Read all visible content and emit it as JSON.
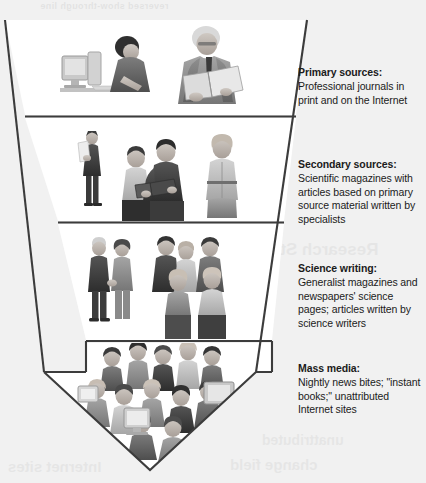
{
  "diagram": {
    "type": "inverted-funnel-arrow",
    "shape_name": "downward arrow funnel",
    "background_color": "#f1f1f1",
    "outline_color": "#3c3c3c",
    "band_fill_color": "#ffffff",
    "band_count": 4
  },
  "bands": [
    {
      "id": "primary",
      "title": "Primary sources:",
      "body": "Professional journals in print and on the Internet",
      "body_lines": [
        "Professional journals",
        "in print and on the",
        "Internet"
      ],
      "image_alt": "A man typing at a desktop computer and an older man in a suit reading a large open journal",
      "figures": [
        "person-at-computer",
        "man-reading-journal"
      ]
    },
    {
      "id": "secondary",
      "title": "Secondary sources:",
      "body": "Scientific magazines with articles based on primary source material written by specialists",
      "body_lines": [
        "Scientific magazines",
        "with articles based on",
        "primary source material",
        "written by specialists"
      ],
      "image_alt": "A standing man reading a document, two people sharing an open book, and a woman standing",
      "figures": [
        "standing-man-reading",
        "two-people-with-book",
        "standing-woman"
      ]
    },
    {
      "id": "science-writing",
      "title": "Science writing:",
      "body": "Generalist magazines and newspapers' science pages; articles written by science writers",
      "body_lines": [
        "Generalist magazines",
        "and newspapers' science",
        "pages; articles written",
        "by science writers"
      ],
      "image_alt": "A couple talking and a small group of several people conversing",
      "figures": [
        "couple-talking",
        "group-of-people"
      ]
    },
    {
      "id": "mass-media",
      "title": "Mass media:",
      "body": "Nightly news bites; \"instant books;\" unattributed Internet sites",
      "body_lines": [
        "Nightly news bites;",
        "\"instant books;\"",
        "unattributed Internet",
        "sites"
      ],
      "image_alt": "A large crowd of many people with computer monitors among them",
      "figures": [
        "large-crowd",
        "computer-monitors"
      ]
    }
  ],
  "ghost_text": {
    "note": "faint show-through from the reverse side of the printed page",
    "top": "reversed show-through line",
    "middle": "Research Study",
    "lower_right": "unattributed",
    "lower_left": "Internet sites",
    "lower_center": "change  field"
  }
}
